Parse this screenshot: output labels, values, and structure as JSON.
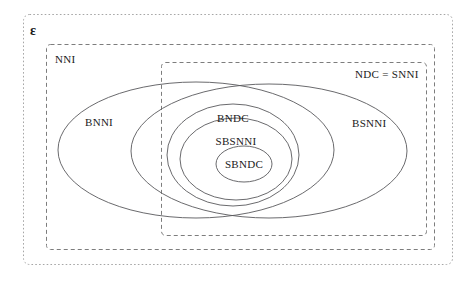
{
  "diagram": {
    "universe": {
      "label": "ε",
      "name": "universe-box"
    },
    "boxes": [
      {
        "id": "nni",
        "label": "NNI",
        "x": 46,
        "y": 44,
        "width": 388,
        "height": 205
      },
      {
        "id": "snni",
        "label": "NDC = SNNI",
        "x": 161,
        "y": 62,
        "width": 265,
        "height": 173
      }
    ],
    "ellipses": [
      {
        "id": "bnni",
        "label": "BNNI",
        "cx": 196,
        "cy": 150,
        "rx": 138,
        "ry": 68,
        "label_x": 100,
        "label_y": 122
      },
      {
        "id": "bsnni",
        "label": "BSNNI",
        "cx": 269,
        "cy": 151,
        "rx": 138,
        "ry": 67,
        "label_x": 371,
        "label_y": 123
      },
      {
        "id": "bndc",
        "label": "BNDC",
        "cx": 233,
        "cy": 155,
        "rx": 66,
        "ry": 51,
        "label_x": 233,
        "label_y": 119
      },
      {
        "id": "sbsnni",
        "label": "SBSNNI",
        "cx": 236,
        "cy": 159,
        "rx": 56,
        "ry": 41,
        "label_x": 236,
        "label_y": 142
      },
      {
        "id": "sbndc",
        "label": "SBNDC",
        "cx": 244,
        "cy": 164,
        "rx": 28,
        "ry": 18,
        "label_x": 244,
        "label_y": 168
      }
    ],
    "colors": {
      "background": "#ffffff",
      "dashed_stroke": "#7d7d7d",
      "universe_stroke": "#a6a6a6",
      "ellipse_stroke": "#59595c",
      "text": "#1a1a1a"
    }
  }
}
